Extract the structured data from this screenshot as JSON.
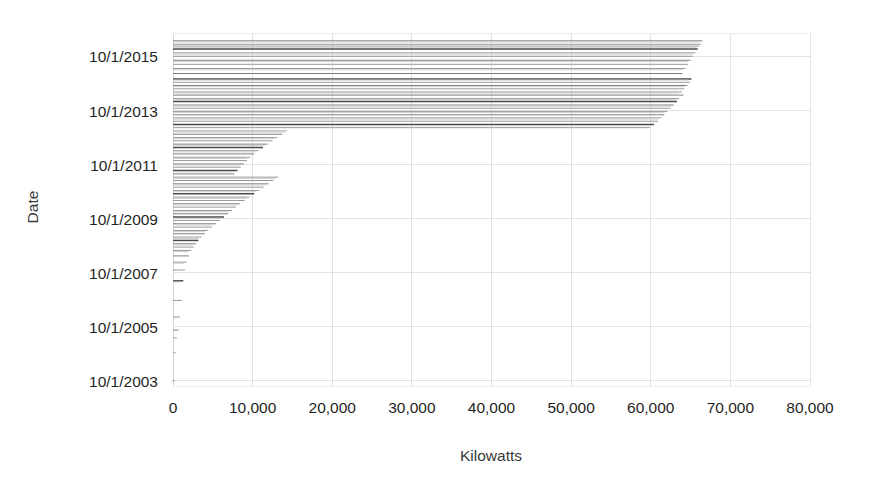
{
  "chart_data": {
    "type": "bar",
    "orientation": "horizontal",
    "title": "",
    "xlabel": "Kilowatts",
    "ylabel": "Date",
    "xlim": [
      0,
      80000
    ],
    "ylim": [
      "10/1/2003",
      "10/1/2016"
    ],
    "grid": true,
    "legend": null,
    "xticks": [
      {
        "value": 0,
        "label": "0"
      },
      {
        "value": 10000,
        "label": "10,000"
      },
      {
        "value": 20000,
        "label": "20,000"
      },
      {
        "value": 30000,
        "label": "30,000"
      },
      {
        "value": 40000,
        "label": "40,000"
      },
      {
        "value": 50000,
        "label": "50,000"
      },
      {
        "value": 60000,
        "label": "60,000"
      },
      {
        "value": 70000,
        "label": "70,000"
      },
      {
        "value": 80000,
        "label": "80,000"
      }
    ],
    "yticks": [
      {
        "value": 2015.75,
        "label": "10/1/2015"
      },
      {
        "value": 2013.75,
        "label": "10/1/2013"
      },
      {
        "value": 2011.75,
        "label": "10/1/2011"
      },
      {
        "value": 2009.75,
        "label": "10/1/2009"
      },
      {
        "value": 2007.75,
        "label": "10/1/2007"
      },
      {
        "value": 2005.75,
        "label": "10/1/2005"
      },
      {
        "value": 2003.75,
        "label": "10/1/2003"
      }
    ],
    "series_name": "Cumulative Kilowatts",
    "note": "Horizontal bar per date: bar length = cumulative kilowatts at that date",
    "categories": [
      "2016-05-01",
      "2016-03-15",
      "2016-02-20",
      "2016-01-10",
      "2015-11-20",
      "2015-10-05",
      "2015-08-12",
      "2015-06-18",
      "2015-04-22",
      "2015-02-14",
      "2014-12-03",
      "2014-10-18",
      "2014-09-05",
      "2014-07-22",
      "2014-06-10",
      "2014-04-28",
      "2014-03-12",
      "2014-02-02",
      "2013-12-15",
      "2013-11-01",
      "2013-09-20",
      "2013-08-05",
      "2013-06-24",
      "2013-05-10",
      "2013-03-28",
      "2013-02-12",
      "2012-12-30",
      "2012-11-15",
      "2012-10-01",
      "2012-08-18",
      "2012-07-04",
      "2012-05-20",
      "2012-04-06",
      "2012-02-22",
      "2012-01-08",
      "2011-11-24",
      "2011-10-10",
      "2011-08-26",
      "2011-07-12",
      "2011-05-28",
      "2011-04-14",
      "2011-02-28",
      "2011-01-14",
      "2010-11-30",
      "2010-10-16",
      "2010-09-01",
      "2010-07-18",
      "2010-06-03",
      "2010-04-19",
      "2010-03-05",
      "2010-01-19",
      "2009-12-05",
      "2009-10-21",
      "2009-09-06",
      "2009-07-23",
      "2009-06-08",
      "2009-04-24",
      "2009-03-10",
      "2009-01-24",
      "2008-12-10",
      "2008-10-26",
      "2008-09-11",
      "2008-07-28",
      "2008-05-14",
      "2008-02-20",
      "2007-11-05",
      "2007-06-12",
      "2006-09-20",
      "2006-02-10",
      "2005-08-15",
      "2005-05-02",
      "2004-10-12",
      "2003-10-01"
    ],
    "values": [
      66500,
      66300,
      66100,
      65900,
      65600,
      65300,
      65000,
      64700,
      64400,
      64000,
      65100,
      64900,
      64600,
      64200,
      63900,
      64100,
      63600,
      63300,
      62900,
      62500,
      62100,
      61700,
      61300,
      60900,
      60400,
      59900,
      14300,
      13700,
      13100,
      12500,
      11900,
      11300,
      10700,
      10200,
      9700,
      9300,
      8900,
      8500,
      8100,
      7700,
      13200,
      12600,
      12000,
      11400,
      10800,
      10200,
      9600,
      9000,
      8400,
      7900,
      7400,
      6900,
      6400,
      5900,
      5400,
      4900,
      4400,
      4000,
      3600,
      3200,
      2900,
      2600,
      2300,
      2000,
      1700,
      1500,
      1300,
      1100,
      900,
      700,
      500,
      350,
      200
    ]
  },
  "axes": {
    "x_label": "Kilowatts",
    "y_label": "Date"
  }
}
